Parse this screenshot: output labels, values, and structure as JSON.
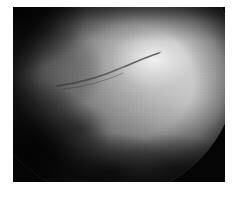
{
  "figure": {
    "kind": "medical-photograph",
    "modality": "endoscopic-fundus-grayscale",
    "caption": "",
    "page_background": "#ffffff",
    "plate_background": "#050505",
    "plate": {
      "x": 13,
      "y": 7,
      "width": 212,
      "height": 175
    },
    "field_of_view": {
      "shape": "circle",
      "center_x": 96,
      "center_y": 62,
      "radius": 128,
      "clipped_edges": [
        "top",
        "left",
        "bottom"
      ]
    },
    "tone": {
      "highlight": "#f5f5f5",
      "midtone": "#a0a0a0",
      "shadow": "#141414",
      "black": "#050505",
      "white": "#ffffff"
    },
    "regions": [
      {
        "name": "central-highlight",
        "label": "bright central tissue",
        "tone": "#e6e6e6"
      },
      {
        "name": "upper-left-lobe",
        "label": "dim upper-left lobe",
        "tone": "#6e6e6e"
      },
      {
        "name": "lower-left-shadow",
        "label": "dark lower-left shadow",
        "tone": "#0c0c0c"
      },
      {
        "name": "bottom-mottling",
        "label": "mottled bottom tissue",
        "tone": "#1e1e1e"
      },
      {
        "name": "right-arc",
        "label": "circular field-of-view arc",
        "tone": "#050505"
      }
    ],
    "features": [
      {
        "name": "diagonal-vessel",
        "label": "faint dark diagonal vessel"
      }
    ]
  }
}
